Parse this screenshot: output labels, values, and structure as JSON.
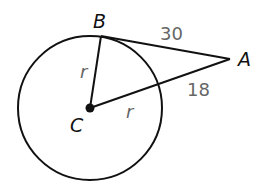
{
  "diagram": {
    "points": {
      "A": "A",
      "B": "B",
      "C": "C"
    },
    "segment_labels": {
      "CB": "r",
      "CD": "r",
      "BA": "30",
      "DA": "18"
    },
    "colors": {
      "stroke": "#111111",
      "number_text": "#666666",
      "point_text": "#111111"
    }
  }
}
